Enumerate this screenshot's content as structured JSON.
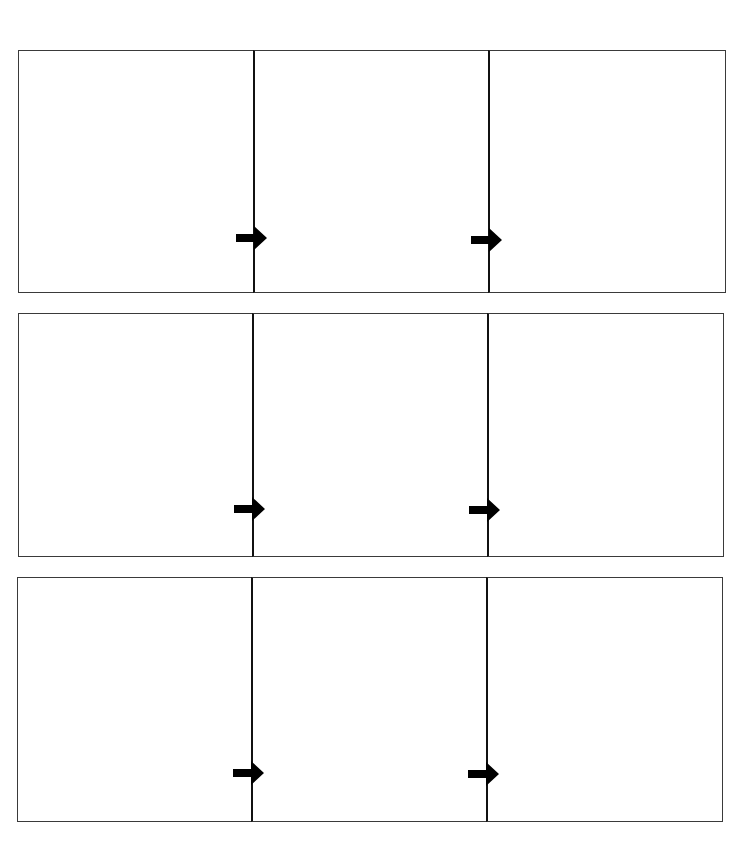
{
  "diagram": {
    "type": "storyboard-flow",
    "colors": {
      "background": "#ffffff",
      "border": "#3a3a3a",
      "divider": "#111111",
      "arrow": "#000000"
    },
    "rows": [
      {
        "top": 50,
        "left": 18,
        "height": 243,
        "panel_widths": [
          235,
          235,
          238
        ],
        "arrows": [
          {
            "x": 236,
            "y": 226
          },
          {
            "x": 471,
            "y": 228
          }
        ]
      },
      {
        "top": 313,
        "left": 18,
        "height": 244,
        "panel_widths": [
          234,
          235,
          237
        ],
        "arrows": [
          {
            "x": 234,
            "y": 497
          },
          {
            "x": 469,
            "y": 498
          }
        ]
      },
      {
        "top": 577,
        "left": 17,
        "height": 245,
        "panel_widths": [
          234,
          235,
          237
        ],
        "arrows": [
          {
            "x": 233,
            "y": 761
          },
          {
            "x": 468,
            "y": 762
          }
        ]
      }
    ]
  }
}
